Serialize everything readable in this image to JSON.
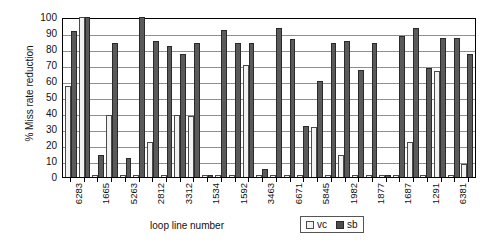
{
  "chart_data": {
    "type": "bar",
    "title": "",
    "xlabel": "loop line number",
    "ylabel": "% Miss rate reduction",
    "ylim": [
      0,
      100
    ],
    "ytick_step": 10,
    "yticks": [
      100,
      90,
      80,
      70,
      60,
      50,
      40,
      30,
      20,
      10,
      0
    ],
    "grid": true,
    "legend_position": "bottom-right",
    "legend": [
      "vc",
      "sb"
    ],
    "categories": [
      "6283",
      "",
      "1665",
      "",
      "5263",
      "",
      "2812",
      "",
      "3312",
      "",
      "1534",
      "",
      "1592",
      "",
      "3463",
      "",
      "6671",
      "",
      "5845",
      "",
      "1982",
      "",
      "1877",
      "",
      "1687",
      "",
      "1291",
      "",
      "6381",
      ""
    ],
    "labeled_categories": [
      "6283",
      "1665",
      "5263",
      "2812",
      "3312",
      "1534",
      "1592",
      "3463",
      "6671",
      "5845",
      "1982",
      "1877",
      "1687",
      "1291",
      "6381"
    ],
    "series": [
      {
        "name": "vc",
        "values": [
          57,
          100,
          1,
          39,
          1,
          1,
          22,
          1,
          39,
          38,
          1,
          1,
          1,
          70,
          1,
          1,
          1,
          1,
          31,
          1,
          14,
          1,
          1,
          1,
          1,
          22,
          1,
          66,
          1,
          8
        ]
      },
      {
        "name": "sb",
        "values": [
          91,
          100,
          14,
          84,
          12,
          100,
          85,
          82,
          77,
          84,
          1,
          92,
          84,
          84,
          5,
          93,
          86,
          32,
          60,
          84,
          85,
          67,
          84,
          1,
          88,
          93,
          68,
          87,
          87,
          77
        ]
      }
    ]
  },
  "axis": {
    "y_label": "% Miss rate reduction",
    "x_label": "loop line number",
    "y_ticks": [
      "100",
      "90",
      "80",
      "70",
      "60",
      "50",
      "40",
      "30",
      "20",
      "10",
      "0"
    ]
  },
  "legend": {
    "items": [
      {
        "label": "vc",
        "color": "#f2f2f2"
      },
      {
        "label": "sb",
        "color": "#4d4d4d"
      }
    ]
  }
}
